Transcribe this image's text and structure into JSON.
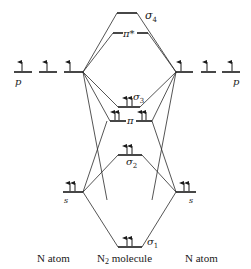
{
  "diagram": {
    "type": "molecular-orbital-energy-diagram",
    "captions": {
      "left": "N atom",
      "center_main": "N",
      "center_sub": "2",
      "center_rest": " molecule",
      "right": "N atom"
    },
    "atomic_orbitals": {
      "left_p_label": "p",
      "left_s_label": "s",
      "right_p_label": "p",
      "right_s_label": "s"
    },
    "molecular_orbitals": {
      "sigma4": {
        "symbol": "σ",
        "sub": "4"
      },
      "pi_star": {
        "symbol": "π*"
      },
      "sigma3": {
        "symbol": "σ",
        "sub": "3"
      },
      "pi": {
        "symbol": "π"
      },
      "sigma2": {
        "symbol": "σ",
        "sub": "2"
      },
      "sigma1": {
        "symbol": "σ",
        "sub": "1"
      }
    },
    "electron_occupancy": {
      "left_p": [
        1,
        1,
        1
      ],
      "right_p": [
        1,
        1,
        1
      ],
      "left_s": 2,
      "right_s": 2,
      "sigma1": 2,
      "sigma2": 2,
      "pi": [
        2,
        2
      ],
      "sigma3": 2,
      "pi_star": 0,
      "sigma4": 0
    }
  }
}
